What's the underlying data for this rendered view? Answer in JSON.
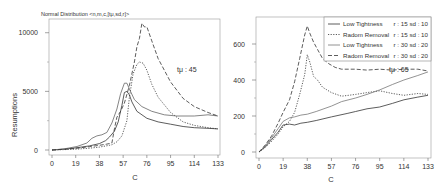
{
  "chart_data": [
    {
      "type": "line",
      "title": "Normal Distribution <n,m,c,[tμ,sd,r]>",
      "xlabel": "C",
      "ylabel": "Resumptions",
      "xlim": [
        0,
        133
      ],
      "ylim": [
        0,
        11000
      ],
      "xticks": [
        0,
        19,
        38,
        57,
        76,
        95,
        114,
        133
      ],
      "yticks": [
        0,
        5000,
        10000
      ],
      "annotation": "tμ : 45",
      "grid": false,
      "series": [
        {
          "name": "Low Tightness r : 15 sd : 10",
          "style": "solid",
          "color": "#333333",
          "x": [
            0,
            10,
            20,
            30,
            38,
            43,
            46,
            50,
            53,
            56,
            58,
            60,
            62,
            64,
            68,
            76,
            85,
            95,
            105,
            114,
            125,
            133
          ],
          "y": [
            0,
            80,
            200,
            350,
            550,
            800,
            1100,
            1600,
            2400,
            3800,
            4900,
            5000,
            4700,
            4100,
            3300,
            2700,
            2400,
            2200,
            2000,
            1900,
            1850,
            1800
          ]
        },
        {
          "name": "Radom Removal r : 15 sd : 10",
          "style": "dotted",
          "color": "#333333",
          "x": [
            0,
            10,
            20,
            30,
            38,
            46,
            48,
            52,
            56,
            60,
            62,
            65,
            68,
            70,
            73,
            76,
            80,
            85,
            95,
            105,
            114,
            125,
            133
          ],
          "y": [
            0,
            30,
            80,
            150,
            250,
            400,
            450,
            700,
            1200,
            2500,
            4500,
            6500,
            7300,
            7500,
            7400,
            6800,
            5600,
            4500,
            3200,
            2400,
            2100,
            1900,
            1800
          ]
        },
        {
          "name": "Low Tightness r : 30 sd : 20",
          "style": "solid",
          "color": "#666666",
          "x": [
            0,
            10,
            20,
            28,
            32,
            36,
            40,
            44,
            48,
            52,
            55,
            58,
            60,
            62,
            66,
            72,
            80,
            90,
            100,
            114,
            125,
            133
          ],
          "y": [
            0,
            100,
            300,
            600,
            1000,
            1200,
            1300,
            1500,
            2300,
            3500,
            4800,
            5700,
            5700,
            5200,
            4300,
            3700,
            3300,
            3000,
            2900,
            2900,
            3000,
            2900
          ]
        },
        {
          "name": "Radom Removal r : 30 sd : 20",
          "style": "dashed",
          "color": "#333333",
          "x": [
            0,
            10,
            20,
            30,
            38,
            44,
            48,
            50,
            52,
            55,
            58,
            62,
            66,
            68,
            70,
            72,
            74,
            76,
            80,
            85,
            95,
            105,
            114,
            125,
            133
          ],
          "y": [
            0,
            60,
            150,
            280,
            400,
            500,
            600,
            1800,
            2800,
            3300,
            4000,
            5500,
            7500,
            8800,
            9500,
            10800,
            10500,
            10500,
            9300,
            7800,
            5800,
            4400,
            3700,
            3200,
            2900
          ]
        }
      ]
    },
    {
      "type": "line",
      "title": "",
      "xlabel": "C",
      "ylabel": "",
      "xlim": [
        0,
        133
      ],
      "ylim": [
        0,
        750
      ],
      "xticks": [
        0,
        19,
        38,
        57,
        76,
        95,
        114,
        133
      ],
      "yticks": [
        0,
        200,
        400,
        600
      ],
      "annotation": "tμ : 65",
      "legend_position": "top-right",
      "grid": false,
      "series": [
        {
          "name": "Low Tightness r : 15 sd : 10",
          "style": "solid",
          "color": "#333333",
          "x": [
            0,
            5,
            10,
            15,
            19,
            24,
            28,
            33,
            38,
            45,
            57,
            70,
            76,
            85,
            95,
            105,
            114,
            125,
            133
          ],
          "y": [
            0,
            30,
            70,
            110,
            150,
            155,
            150,
            160,
            165,
            175,
            195,
            215,
            225,
            240,
            250,
            270,
            290,
            305,
            315
          ]
        },
        {
          "name": "Radom Removal r : 15 sd : 10",
          "style": "dotted",
          "color": "#333333",
          "x": [
            0,
            5,
            10,
            15,
            19,
            24,
            28,
            32,
            36,
            38,
            40,
            43,
            46,
            50,
            57,
            65,
            76,
            85,
            95,
            105,
            114,
            125,
            133
          ],
          "y": [
            0,
            25,
            60,
            100,
            140,
            170,
            220,
            320,
            430,
            540,
            500,
            420,
            400,
            360,
            330,
            310,
            320,
            330,
            340,
            325,
            315,
            325,
            320
          ]
        },
        {
          "name": "Low Tightness r : 30 sd : 20",
          "style": "solid",
          "color": "#777777",
          "x": [
            0,
            5,
            10,
            15,
            19,
            24,
            28,
            33,
            38,
            45,
            57,
            65,
            76,
            85,
            95,
            105,
            114,
            125,
            133
          ],
          "y": [
            0,
            35,
            80,
            130,
            170,
            190,
            195,
            205,
            210,
            225,
            255,
            280,
            300,
            320,
            345,
            375,
            400,
            425,
            445
          ]
        },
        {
          "name": "Radom Removal r : 30 sd : 20",
          "style": "dashed",
          "color": "#333333",
          "x": [
            0,
            5,
            10,
            15,
            19,
            24,
            28,
            32,
            36,
            38,
            40,
            43,
            46,
            50,
            55,
            60,
            65,
            76,
            85,
            95,
            105,
            114,
            125,
            133
          ],
          "y": [
            0,
            40,
            90,
            160,
            220,
            290,
            390,
            520,
            650,
            700,
            660,
            610,
            570,
            520,
            490,
            470,
            460,
            460,
            455,
            460,
            455,
            460,
            460,
            450
          ]
        }
      ]
    }
  ]
}
